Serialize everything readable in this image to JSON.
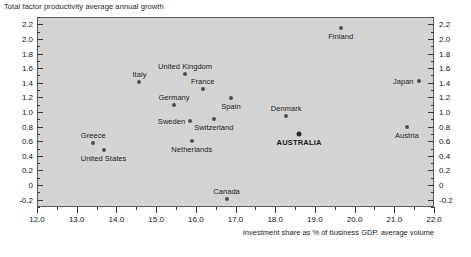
{
  "chart_data": {
    "type": "scatter",
    "title": "Total factor productivity average annual growth",
    "xlabel": "Investment share as % of business GDP, average volume",
    "ylabel": "",
    "xlim": [
      12.0,
      22.0
    ],
    "ylim": [
      -0.3,
      2.3
    ],
    "grid": false,
    "legend": "none",
    "x_major_ticks": [
      "12.0",
      "13.0",
      "14.0",
      "15.0",
      "16.0",
      "17.0",
      "18.0",
      "19.0",
      "20.0",
      "21.0",
      "22.0"
    ],
    "x_minor_interval": 0.5,
    "y_major_ticks": [
      "2.2",
      "2.0",
      "1.8",
      "1.6",
      "1.4",
      "1.2",
      "1.0",
      "0.8",
      "0.6",
      "0.4",
      "0.2",
      "0",
      "-0.2"
    ],
    "y_minor_interval": 0.1,
    "y_axis_duplicated_right": true,
    "points": [
      {
        "name": "Greece",
        "x": 13.42,
        "y": 0.57,
        "label": "Greece",
        "label_pos": "above",
        "emphasis": false
      },
      {
        "name": "United States",
        "x": 13.68,
        "y": 0.48,
        "label": "United States",
        "label_pos": "below",
        "emphasis": false
      },
      {
        "name": "Italy",
        "x": 14.58,
        "y": 1.41,
        "label": "Italy",
        "label_pos": "above",
        "emphasis": false
      },
      {
        "name": "Germany",
        "x": 15.45,
        "y": 1.1,
        "label": "Germany",
        "label_pos": "above",
        "emphasis": false
      },
      {
        "name": "United Kingdom",
        "x": 15.73,
        "y": 1.52,
        "label": "United Kingdom",
        "label_pos": "above",
        "emphasis": false
      },
      {
        "name": "Sweden",
        "x": 15.85,
        "y": 0.88,
        "label": "Sweden",
        "label_pos": "left",
        "emphasis": false
      },
      {
        "name": "Netherlands",
        "x": 15.9,
        "y": 0.61,
        "label": "Netherlands",
        "label_pos": "below",
        "emphasis": false
      },
      {
        "name": "France",
        "x": 16.18,
        "y": 1.31,
        "label": "France",
        "label_pos": "above",
        "emphasis": false
      },
      {
        "name": "Switzerland",
        "x": 16.45,
        "y": 0.91,
        "label": "Switzerland",
        "label_pos": "below",
        "emphasis": false
      },
      {
        "name": "Spain",
        "x": 16.88,
        "y": 1.19,
        "label": "Spain",
        "label_pos": "below",
        "emphasis": false
      },
      {
        "name": "Canada",
        "x": 16.78,
        "y": -0.19,
        "label": "Canada",
        "label_pos": "above",
        "emphasis": false
      },
      {
        "name": "Denmark",
        "x": 18.28,
        "y": 0.95,
        "label": "Denmark",
        "label_pos": "above",
        "emphasis": false
      },
      {
        "name": "AUSTRALIA",
        "x": 18.6,
        "y": 0.7,
        "label": "AUSTRALIA",
        "label_pos": "below",
        "emphasis": true
      },
      {
        "name": "Finland",
        "x": 19.65,
        "y": 2.15,
        "label": "Finland",
        "label_pos": "below",
        "emphasis": false
      },
      {
        "name": "Austria",
        "x": 21.32,
        "y": 0.79,
        "label": "Austria",
        "label_pos": "below",
        "emphasis": false
      },
      {
        "name": "Japan",
        "x": 21.62,
        "y": 1.42,
        "label": "Japan",
        "label_pos": "left",
        "emphasis": false
      }
    ],
    "colors": {
      "plot_background": "#d4d4d4",
      "marker": "#4f4f4f",
      "marker_emphasis": "#2b2b2b",
      "axis": "#5a5a5a",
      "text": "#1a1a1a"
    }
  }
}
